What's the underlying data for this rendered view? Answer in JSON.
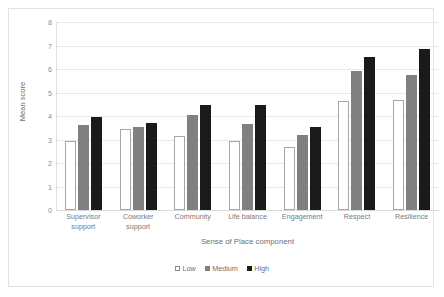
{
  "chart_data": {
    "type": "bar",
    "title": "",
    "xlabel": "Sense of Place component",
    "ylabel": "Mean score",
    "ylim": [
      0,
      8
    ],
    "yticks": [
      8,
      7,
      6,
      5,
      4,
      3,
      2,
      1,
      0
    ],
    "grid": true,
    "legend_position": "bottom",
    "categories": [
      "Supervisor support",
      "Coworker support",
      "Community",
      "Life balance",
      "Engagement",
      "Respect",
      "Resilience"
    ],
    "series": [
      {
        "name": "Low",
        "color": "#ffffff",
        "values": [
          2.95,
          3.45,
          3.15,
          2.95,
          2.7,
          4.65,
          4.7
        ]
      },
      {
        "name": "Medium",
        "color": "#808080",
        "values": [
          3.6,
          3.55,
          4.05,
          3.65,
          3.2,
          5.9,
          5.75
        ]
      },
      {
        "name": "High",
        "color": "#1a1a1a",
        "values": [
          3.95,
          3.7,
          4.45,
          4.45,
          3.55,
          6.5,
          6.85
        ]
      }
    ]
  },
  "legend": {
    "items": [
      {
        "label": "Low"
      },
      {
        "label": "Medium"
      },
      {
        "label": "High"
      }
    ]
  }
}
